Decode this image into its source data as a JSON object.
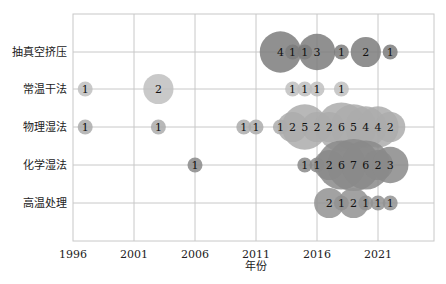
{
  "chart_data": {
    "type": "scatter",
    "subtype": "bubble",
    "title": "",
    "xlabel": "年份",
    "ylabel": "",
    "xlim": [
      1996,
      2025.7
    ],
    "x_ticks": [
      1996,
      2001,
      2006,
      2011,
      2016,
      2021
    ],
    "categories": [
      "抽真空挤压",
      "常温干法",
      "物理湿法",
      "化学湿法",
      "高温处理"
    ],
    "grid": true,
    "legend": null,
    "series": [
      {
        "name": "抽真空挤压",
        "color": "#7d7d7d",
        "points": [
          {
            "x": 2013,
            "value": 4
          },
          {
            "x": 2014,
            "value": 1
          },
          {
            "x": 2015,
            "value": 1
          },
          {
            "x": 2016,
            "value": 3
          },
          {
            "x": 2018,
            "value": 1
          },
          {
            "x": 2020,
            "value": 2
          },
          {
            "x": 2022,
            "value": 1
          }
        ]
      },
      {
        "name": "常温干法",
        "color": "#bfbfbf",
        "points": [
          {
            "x": 1997,
            "value": 1
          },
          {
            "x": 2003,
            "value": 2
          },
          {
            "x": 2014,
            "value": 1
          },
          {
            "x": 2015,
            "value": 1
          },
          {
            "x": 2016,
            "value": 1
          },
          {
            "x": 2018,
            "value": 1
          }
        ]
      },
      {
        "name": "物理湿法",
        "color": "#ababab",
        "points": [
          {
            "x": 1997,
            "value": 1
          },
          {
            "x": 2003,
            "value": 1
          },
          {
            "x": 2010,
            "value": 1
          },
          {
            "x": 2011,
            "value": 1
          },
          {
            "x": 2013,
            "value": 1
          },
          {
            "x": 2014,
            "value": 2
          },
          {
            "x": 2015,
            "value": 5
          },
          {
            "x": 2016,
            "value": 2
          },
          {
            "x": 2017,
            "value": 2
          },
          {
            "x": 2018,
            "value": 6
          },
          {
            "x": 2019,
            "value": 5
          },
          {
            "x": 2020,
            "value": 4
          },
          {
            "x": 2021,
            "value": 4
          },
          {
            "x": 2022,
            "value": 2
          }
        ]
      },
      {
        "name": "化学湿法",
        "color": "#8a8a8a",
        "points": [
          {
            "x": 2006,
            "value": 1
          },
          {
            "x": 2015,
            "value": 1
          },
          {
            "x": 2016,
            "value": 1
          },
          {
            "x": 2017,
            "value": 2
          },
          {
            "x": 2018,
            "value": 6
          },
          {
            "x": 2019,
            "value": 7
          },
          {
            "x": 2020,
            "value": 6
          },
          {
            "x": 2021,
            "value": 2
          },
          {
            "x": 2022,
            "value": 3
          }
        ]
      },
      {
        "name": "高温处理",
        "color": "#929292",
        "points": [
          {
            "x": 2017,
            "value": 2
          },
          {
            "x": 2018,
            "value": 1
          },
          {
            "x": 2019,
            "value": 2
          },
          {
            "x": 2020,
            "value": 1
          },
          {
            "x": 2021,
            "value": 1
          },
          {
            "x": 2022,
            "value": 1
          }
        ]
      }
    ]
  }
}
